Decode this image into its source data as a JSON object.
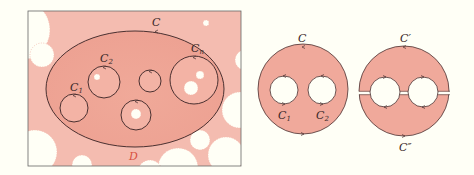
{
  "figure": {
    "left_panel": {
      "outer_curve_label": "C",
      "inner_labels": {
        "c1": "C",
        "c1_sub": "1",
        "c2": "C",
        "c2_sub": "2",
        "cn": "C",
        "cn_sub": "n"
      },
      "domain_label": "D"
    },
    "middle_panel": {
      "outer_label": "C",
      "inner_labels": {
        "c1": "C",
        "c1_sub": "1",
        "c2": "C",
        "c2_sub": "2"
      }
    },
    "right_panel": {
      "top_label": "C′",
      "bottom_label": "C″"
    },
    "colors": {
      "background": "#fffff6",
      "domain_fill": "#f2b3a6",
      "inner_fill": "#eea698",
      "curve_stroke": "#4a3030",
      "label_D": "#d85040",
      "frame": "#666666"
    }
  }
}
